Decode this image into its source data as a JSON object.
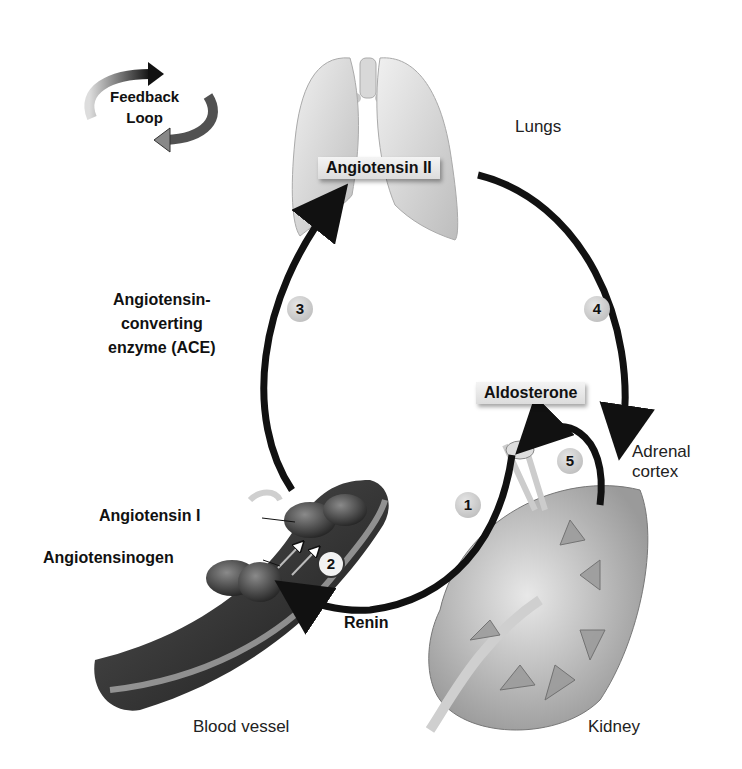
{
  "legend": {
    "title_line1": "Feedback",
    "title_line2": "Loop"
  },
  "organs": {
    "lungs": "Lungs",
    "blood_vessel": "Blood vessel",
    "kidney": "Kidney",
    "adrenal_line1": "Adrenal",
    "adrenal_line2": "cortex"
  },
  "substances": {
    "angiotensin_ii": "Angiotensin II",
    "aldosterone": "Aldosterone",
    "angiotensin_i": "Angiotensin I",
    "angiotensinogen": "Angiotensinogen",
    "renin": "Renin",
    "ace_line1": "Angiotensin-",
    "ace_line2": "converting",
    "ace_line3": "enzyme (ACE)"
  },
  "steps": [
    "1",
    "2",
    "3",
    "4",
    "5"
  ],
  "colors": {
    "arrow": "#111111",
    "step_fill": "#c8c8c8",
    "organ_light": "#d9d9d9",
    "vessel_dark": "#2a2a2a"
  }
}
